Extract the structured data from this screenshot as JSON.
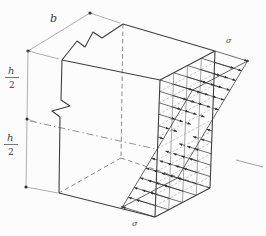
{
  "figure": {
    "type": "beam-bending-stress-diagram",
    "background": "#fcfcfc",
    "colors": {
      "edge": "#3f3f3f",
      "dimension": "#8c8c8c",
      "grid": "#6a6a6a",
      "arrow": "#2f2f2f",
      "axis": "#787878"
    },
    "labels": {
      "b": "b",
      "h_upper": {
        "num": "h",
        "den": "2"
      },
      "h_lower": {
        "num": "h",
        "den": "2"
      },
      "sigma_top": "σ",
      "sigma_bottom": "σ"
    }
  }
}
